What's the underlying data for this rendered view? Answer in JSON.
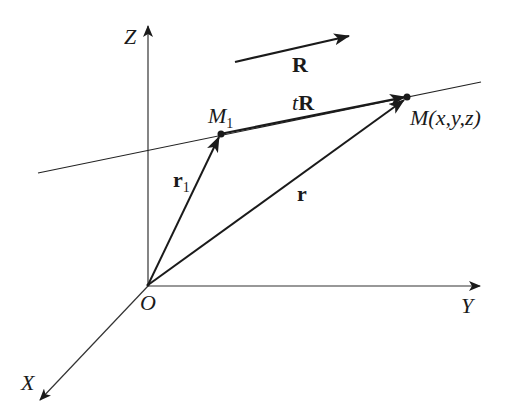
{
  "diagram": {
    "type": "vector line in 3D space",
    "axes": {
      "z_label": "Z",
      "y_label": "Y",
      "x_label": "X",
      "origin_label": "O"
    },
    "points": {
      "m1_label": "M",
      "m1_sub": "1",
      "m_label": "M(x,y,z)"
    },
    "vectors": {
      "direction_label": "R",
      "tR_italic": "t",
      "tR_bold": "R",
      "r1_label": "r",
      "r1_sub": "1",
      "r_label": "r"
    },
    "colors": {
      "stroke": "#1a1a1a",
      "axis": "#333333",
      "background": "#ffffff"
    }
  }
}
